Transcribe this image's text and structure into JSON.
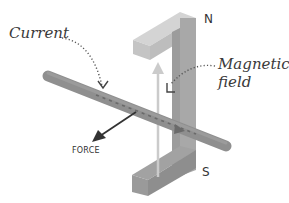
{
  "diagram": {
    "type": "motor-effect",
    "labels": {
      "current": "Current",
      "magnetic_field_line1": "Magnetic",
      "magnetic_field_line2": "field",
      "north_pole": "N",
      "south_pole": "S",
      "force": "FORCE"
    },
    "components": [
      {
        "id": "magnet",
        "description": "U-shaped magnet with N pole at top and S pole at bottom"
      },
      {
        "id": "conductor",
        "description": "Rod carrying current, passing between the poles"
      },
      {
        "id": "field-arrow",
        "description": "Vertical arrow from S to N representing the magnetic field"
      },
      {
        "id": "force-arrow",
        "description": "Arrow pointing down-left labelled FORCE"
      }
    ],
    "colors": {
      "background": "#ffffff",
      "magnet_light": "#cfcfcf",
      "magnet_mid": "#b5b5b5",
      "magnet_dark": "#9a9a9a",
      "magnet_bottom": "#8e8e8e",
      "rod": "#8f8f8f",
      "rod_dark": "#6f6f6f",
      "field_arrow": "#c8c8c8",
      "force_arrow": "#333333",
      "text": "#333333",
      "dotted_leader": "#555555"
    }
  }
}
